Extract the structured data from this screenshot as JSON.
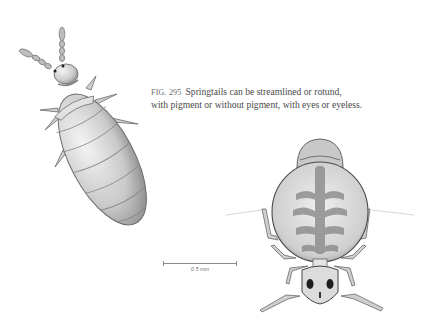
{
  "figure": {
    "number_label": "FIG. 295",
    "caption_line1": "Springtails can be streamlined or rotund,",
    "caption_line2": "with pigment or without pigment, with eyes or eyeless."
  },
  "scale_bar": {
    "label": "0.5 mm"
  },
  "illustrations": [
    {
      "name": "streamlined-springtail",
      "description": "Elongated, unpigmented springtail with eyes"
    },
    {
      "name": "rotund-springtail",
      "description": "Globular, pigmented springtail with eyes"
    }
  ],
  "colors": {
    "background": "#ffffff",
    "ink": "#4a4a4a"
  }
}
